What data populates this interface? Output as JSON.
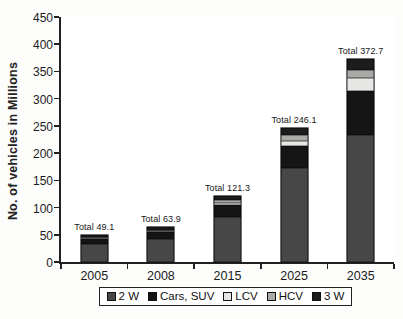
{
  "chart_data": {
    "type": "bar",
    "stacked": true,
    "title": "",
    "xlabel": "",
    "ylabel": "No. of vehicles in Millions",
    "ylim": [
      0,
      450
    ],
    "yticks": [
      0,
      50,
      100,
      150,
      200,
      250,
      300,
      350,
      400,
      450
    ],
    "grid": false,
    "legend_position": "bottom",
    "categories": [
      "2005",
      "2008",
      "2015",
      "2025",
      "2035"
    ],
    "series": [
      {
        "name": "2 W",
        "color": "#474747",
        "textured": true,
        "values": [
          34.0,
          42.0,
          82.0,
          172.0,
          233.0
        ]
      },
      {
        "name": "Cars, SUV",
        "color": "#151515",
        "textured": false,
        "values": [
          8.0,
          13.0,
          22.0,
          41.0,
          81.7
        ]
      },
      {
        "name": "LCV",
        "color": "#e7e7e5",
        "textured": false,
        "values": [
          1.5,
          1.7,
          4.5,
          9.0,
          23.0
        ]
      },
      {
        "name": "HCV",
        "color": "#a9a9a7",
        "textured": false,
        "values": [
          2.0,
          2.2,
          5.0,
          11.0,
          15.0
        ]
      },
      {
        "name": "3 W",
        "color": "#1c1c1c",
        "textured": false,
        "values": [
          3.6,
          5.0,
          7.8,
          13.1,
          20.0
        ]
      }
    ],
    "totals": [
      49.1,
      63.9,
      121.3,
      246.1,
      372.7
    ],
    "total_label_prefix": "Total ",
    "annotations": [
      "Total 49.1",
      "Total 63.9",
      "Total 121.3",
      "Total 246.1",
      "Total 372.7"
    ]
  }
}
